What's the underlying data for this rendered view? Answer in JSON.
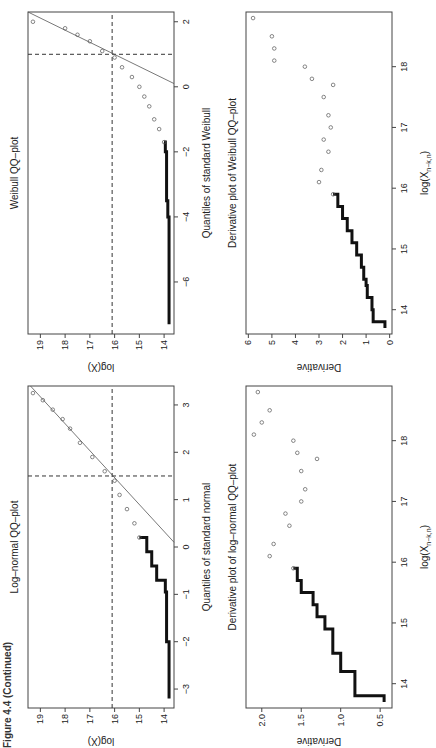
{
  "caption": "Figure 4.4 (Continued)",
  "chart_data": [
    {
      "id": "lognormal_qq",
      "type": "scatter",
      "title": "Log–normal QQ–plot",
      "xlabel": "Quantiles of standard normal",
      "ylabel": "log(X)",
      "xticks": [
        -3,
        -2,
        -1,
        0,
        1,
        2,
        3
      ],
      "yticks": [
        14,
        15,
        16,
        17,
        18,
        19
      ],
      "xlim": [
        -3.4,
        3.4
      ],
      "ylim": [
        13.6,
        19.5
      ],
      "hline": 16.1,
      "vline": 1.5,
      "refline": {
        "x": [
          0.1,
          3.4
        ],
        "y": [
          13.6,
          19.4
        ]
      },
      "x": [
        -3.2,
        -2.9,
        -2.6,
        -2.3,
        -2.0,
        -1.6,
        -1.2,
        -0.95,
        -0.7,
        -0.4,
        -0.1,
        0.2,
        0.5,
        0.8,
        1.1,
        1.4,
        1.6,
        1.9,
        2.2,
        2.5,
        2.7,
        2.9,
        3.1,
        3.25
      ],
      "y": [
        13.8,
        13.8,
        13.8,
        13.8,
        13.9,
        13.9,
        13.9,
        13.95,
        14.3,
        14.5,
        14.7,
        15.0,
        15.2,
        15.5,
        15.8,
        16.0,
        16.4,
        16.9,
        17.4,
        17.8,
        18.1,
        18.5,
        18.9,
        19.3
      ]
    },
    {
      "id": "lognormal_derivative",
      "type": "scatter",
      "title": "Derivative plot of log–normal QQ–plot",
      "xlabel": "log(X_{n−k,n})",
      "ylabel": "Derivative",
      "xticks": [
        14,
        15,
        16,
        17,
        18
      ],
      "yticks": [
        0.5,
        1.0,
        1.5,
        2.0
      ],
      "xlim": [
        13.6,
        18.9
      ],
      "ylim": [
        0.35,
        2.2
      ],
      "x": [
        13.7,
        13.8,
        14.0,
        14.2,
        14.4,
        14.5,
        14.7,
        14.9,
        15.1,
        15.3,
        15.5,
        15.7,
        15.9,
        16.1,
        16.3,
        16.6,
        16.8,
        17.0,
        17.2,
        17.5,
        17.7,
        17.8,
        18.0,
        18.1,
        18.3,
        18.5,
        18.8
      ],
      "y": [
        0.45,
        0.82,
        0.82,
        1.0,
        1.0,
        1.1,
        1.1,
        1.2,
        1.3,
        1.35,
        1.5,
        1.55,
        1.6,
        1.9,
        1.85,
        1.65,
        1.7,
        1.5,
        1.45,
        1.5,
        1.3,
        1.55,
        1.6,
        2.1,
        2.0,
        1.9,
        2.05
      ]
    },
    {
      "id": "weibull_qq",
      "type": "scatter",
      "title": "Weibull QQ–plot",
      "xlabel": "Quantiles of standard Weibull",
      "ylabel": "log(X)",
      "xticks": [
        -6,
        -4,
        -2,
        0,
        2
      ],
      "yticks": [
        14,
        15,
        16,
        17,
        18,
        19
      ],
      "xlim": [
        -7.6,
        2.3
      ],
      "ylim": [
        13.6,
        19.5
      ],
      "hline": 16.1,
      "vline": 1.0,
      "refline": {
        "x": [
          0.1,
          2.3
        ],
        "y": [
          13.6,
          19.5
        ]
      },
      "x": [
        -7.3,
        -6.5,
        -6.0,
        -5.5,
        -5.0,
        -4.5,
        -4.0,
        -3.5,
        -3.0,
        -2.5,
        -2.0,
        -1.7,
        -1.3,
        -1.0,
        -0.6,
        -0.3,
        0.0,
        0.3,
        0.6,
        0.9,
        1.1,
        1.4,
        1.6,
        1.8,
        2.0
      ],
      "y": [
        13.8,
        13.8,
        13.8,
        13.8,
        13.8,
        13.8,
        13.85,
        13.9,
        13.9,
        13.9,
        13.95,
        14.0,
        14.2,
        14.4,
        14.6,
        14.8,
        15.0,
        15.3,
        15.7,
        16.0,
        16.5,
        17.0,
        17.5,
        18.0,
        19.3
      ]
    },
    {
      "id": "weibull_derivative",
      "type": "scatter",
      "title": "Derivative plot of Weibull QQ–plot",
      "xlabel": "log(X_{n−k,n})",
      "ylabel": "Derivative",
      "xticks": [
        14,
        15,
        16,
        17,
        18
      ],
      "yticks": [
        0,
        1,
        2,
        3,
        4,
        5,
        6
      ],
      "xlim": [
        13.6,
        18.9
      ],
      "ylim": [
        -0.1,
        6.1
      ],
      "x": [
        13.7,
        13.8,
        14.0,
        14.2,
        14.4,
        14.5,
        14.7,
        14.9,
        15.1,
        15.3,
        15.5,
        15.7,
        15.9,
        16.1,
        16.3,
        16.6,
        16.8,
        17.0,
        17.2,
        17.5,
        17.7,
        17.8,
        18.0,
        18.1,
        18.3,
        18.5,
        18.8
      ],
      "y": [
        0.2,
        0.7,
        0.75,
        0.95,
        1.0,
        1.1,
        1.2,
        1.4,
        1.6,
        1.8,
        2.0,
        2.2,
        2.4,
        3.0,
        2.9,
        2.6,
        2.8,
        2.5,
        2.6,
        2.8,
        2.4,
        3.3,
        3.6,
        4.9,
        4.9,
        5.0,
        5.8
      ]
    }
  ]
}
